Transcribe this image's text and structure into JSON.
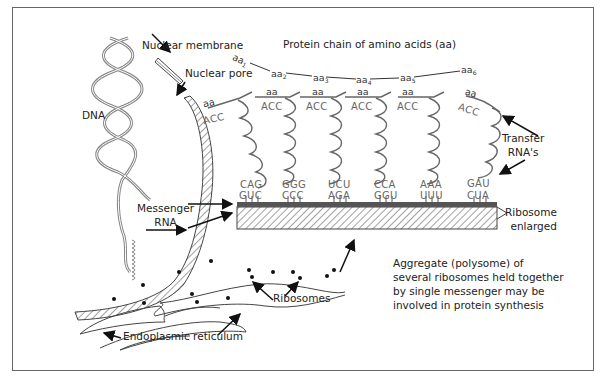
{
  "diagram": {
    "title": "Protein chain of amino acids (aa)",
    "labels": {
      "dna": "DNA",
      "nuclear_membrane": "Nuclear membrane",
      "nuclear_pore": "Nuclear pore",
      "messenger_rna_line1": "Messenger",
      "messenger_rna_line2": "RNA",
      "transfer_rna_line1": "Transfer",
      "transfer_rna_line2": "RNA's",
      "ribosome_line1": "Ribosome",
      "ribosome_line2": "enlarged",
      "ribosomes": "Ribosomes",
      "endoplasmic_reticulum": "Endoplasmic reticulum"
    },
    "protein_chain": [
      {
        "base": "aa",
        "sub": "1"
      },
      {
        "base": "aa",
        "sub": "2"
      },
      {
        "base": "aa",
        "sub": "3"
      },
      {
        "base": "aa",
        "sub": "4"
      },
      {
        "base": "aa",
        "sub": "5"
      },
      {
        "base": "aa",
        "sub": "6"
      }
    ],
    "trnas": [
      {
        "aa": "aa",
        "anticodon_top": "ACC",
        "anticodon": "CAG",
        "codon": "GUC"
      },
      {
        "aa": "aa",
        "anticodon_top": "ACC",
        "anticodon": "GGG",
        "codon": "CCC"
      },
      {
        "aa": "aa",
        "anticodon_top": "ACC",
        "anticodon": "UCU",
        "codon": "AGA"
      },
      {
        "aa": "aa",
        "anticodon_top": "ACC",
        "anticodon": "CCA",
        "codon": "GGU"
      },
      {
        "aa": "aa",
        "anticodon_top": "ACC",
        "anticodon": "AAA",
        "codon": "UUU"
      },
      {
        "aa": "aa",
        "anticodon_top": "ACC",
        "anticodon": "GAU",
        "codon": "CUA"
      }
    ],
    "caption": [
      "Aggregate (polysome) of",
      "several ribosomes held together",
      "by single messenger may be",
      "involved in protein synthesis"
    ]
  }
}
